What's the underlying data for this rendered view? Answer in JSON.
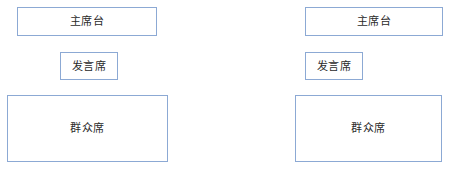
{
  "page": {
    "background_color": "#ffffff",
    "box_border_color": "#8ca9d4",
    "box_fill_color": "#ffffff",
    "label_text_color": "#2b2b2b"
  },
  "diagrams": [
    {
      "name": "left-layout",
      "boxes": [
        {
          "id": "rostrum",
          "label": "主席台"
        },
        {
          "id": "speaker",
          "label": "发言席"
        },
        {
          "id": "audience",
          "label": "群众席"
        }
      ]
    },
    {
      "name": "right-layout",
      "boxes": [
        {
          "id": "rostrum",
          "label": "主席台"
        },
        {
          "id": "speaker",
          "label": "发言席"
        },
        {
          "id": "audience",
          "label": "群众席"
        }
      ]
    }
  ]
}
